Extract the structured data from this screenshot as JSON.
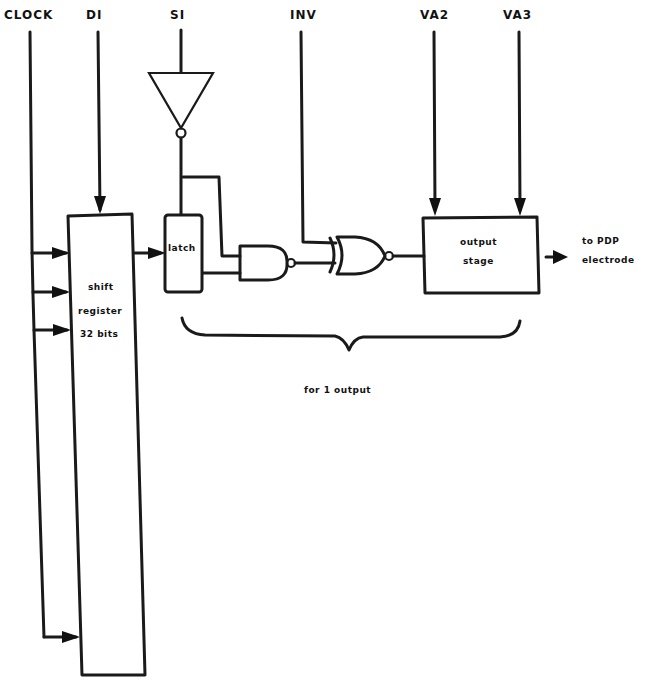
{
  "diagram": {
    "type": "circuit-block-diagram",
    "signals": {
      "clock": "CLOCK",
      "di": "DI",
      "si": "SI",
      "inv": "INV",
      "va2": "VA2",
      "va3": "VA3"
    },
    "blocks": {
      "shift_register": [
        "shift",
        "register",
        "32 bits"
      ],
      "latch": "latch",
      "output_stage": [
        "output",
        "stage"
      ]
    },
    "output_label": [
      "to PDP",
      "electrode"
    ],
    "brace_label": "for 1 output",
    "gates": [
      "inverter",
      "nand",
      "xnor"
    ]
  }
}
